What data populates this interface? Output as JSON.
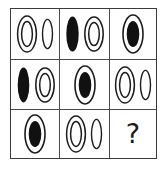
{
  "puzzle": {
    "type": "raven-progressive-matrix",
    "rows": 3,
    "columns": 3,
    "missing_cell": "row3-col3",
    "missing_marker": "?",
    "colors": {
      "stroke": "#1c1c1c",
      "fill": "#111111",
      "grid_line": "#4a4a4a",
      "border": "#3a3a3a",
      "background": "#ffffff"
    },
    "shape_legend": {
      "double-ring": "ellipse with two concentric outlines, hollow center",
      "thin-outline": "narrow hollow ellipse outline",
      "solid": "solid filled black ellipse",
      "outline-with-fill": "ellipse outline containing a solid filled black ellipse"
    },
    "cells": [
      {
        "id": "row1-col1",
        "row": 1,
        "column": 1,
        "label": "double-ring and thin-outline",
        "shapes": [
          "double-ring",
          "thin-outline"
        ]
      },
      {
        "id": "row1-col2",
        "row": 1,
        "column": 2,
        "label": "solid and double-ring",
        "shapes": [
          "solid",
          "double-ring"
        ]
      },
      {
        "id": "row1-col3",
        "row": 1,
        "column": 3,
        "label": "outline with filled center",
        "shapes": [
          "outline-with-fill"
        ]
      },
      {
        "id": "row2-col1",
        "row": 2,
        "column": 1,
        "label": "solid and double-ring",
        "shapes": [
          "solid",
          "double-ring"
        ]
      },
      {
        "id": "row2-col2",
        "row": 2,
        "column": 2,
        "label": "outline with filled center",
        "shapes": [
          "outline-with-fill"
        ]
      },
      {
        "id": "row2-col3",
        "row": 2,
        "column": 3,
        "label": "double-ring and thin-outline",
        "shapes": [
          "double-ring",
          "thin-outline"
        ]
      },
      {
        "id": "row3-col1",
        "row": 3,
        "column": 1,
        "label": "outline with filled center",
        "shapes": [
          "outline-with-fill"
        ]
      },
      {
        "id": "row3-col2",
        "row": 3,
        "column": 2,
        "label": "double-ring and thin-outline",
        "shapes": [
          "double-ring",
          "thin-outline"
        ]
      },
      {
        "id": "row3-col3",
        "row": 3,
        "column": 3,
        "label": "unknown answer",
        "shapes": [
          "question-mark"
        ]
      }
    ]
  }
}
